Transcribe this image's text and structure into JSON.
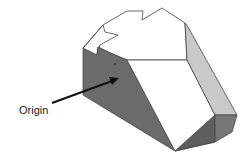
{
  "figure": {
    "type": "3d-solid-isometric-diagram",
    "annotation": {
      "label": "Origin",
      "arrow": true
    },
    "colors": {
      "background": "#ffffff",
      "outline": "#444444",
      "top_face": "#ffffff",
      "front_face": "#ffffff",
      "left_face": "#6b6b6b",
      "right_face": "#c9c9c9",
      "bottom_face_a": "#5e5e5e",
      "bottom_face_b": "#767676",
      "arrow": "#111111"
    }
  }
}
